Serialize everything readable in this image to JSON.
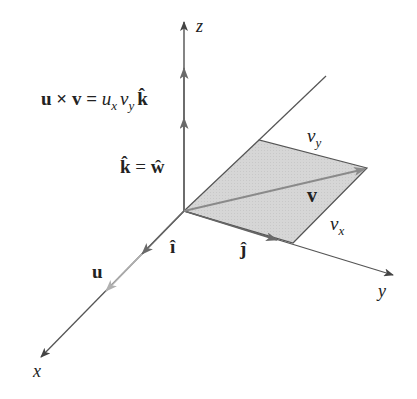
{
  "figure": {
    "colors": {
      "axis": "#555555",
      "parallelogram_fill": "#d4d4d4",
      "parallelogram_edge": "#555555",
      "vector_v": "#7a7a7a",
      "vector_u": "#aaaaaa",
      "unit_vectors": "#666666",
      "text": "#222222"
    },
    "axes": {
      "z_label": "z",
      "y_label": "y",
      "x_label": "x"
    },
    "labels": {
      "cross_product_lhs": "u × v = ",
      "cross_product_ux": "u",
      "cross_product_ux_sub": "x",
      "cross_product_vy": "v",
      "cross_product_vy_sub": "y",
      "cross_product_k": "k̂",
      "k_equals_w_k": "k̂",
      "k_equals_w_eq": " = ",
      "k_equals_w_w": "ŵ",
      "i_hat": "î",
      "j_hat": "ĵ",
      "u": "u",
      "v": "v",
      "vy_main": "v",
      "vy_sub": "y",
      "vx_main": "v",
      "vx_sub": "x"
    }
  }
}
